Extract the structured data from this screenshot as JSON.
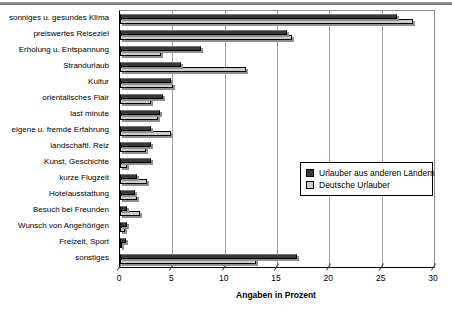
{
  "page": {
    "x_axis_title": "Angaben in Prozent"
  },
  "colors": {
    "series_foreign": "#383838",
    "series_german": "#cdcdcd",
    "gridline": "#a0a0a0",
    "axis": "#000000",
    "plot_border": "#8c8c8c",
    "bar_shadow": "#8f8f8f",
    "top_rule": "#808080",
    "background": "#ffffff"
  },
  "chart_data": {
    "type": "bar",
    "orientation": "horizontal",
    "title": "",
    "xlabel": "Angaben in Prozent",
    "ylabel": "",
    "xlim": [
      0,
      30
    ],
    "xticks": [
      0,
      5,
      10,
      15,
      20,
      25,
      30
    ],
    "grid": true,
    "legend_position": "center-right-inside",
    "categories": [
      "sonniges u. gesundes Klima",
      "preiswertes Reiseziel",
      "Erholung u. Entspannung",
      "Strandurlaub",
      "Kultur",
      "orientalisches Flair",
      "last minute",
      "eigene u. fremde Erfahrung",
      "landschaftl. Reiz",
      "Kunst, Geschichte",
      "kurze Flugzeit",
      "Hotelausstattung",
      "Besuch bei Freunden",
      "Wunsch von Angehörigen",
      "Freizeit, Sport",
      "sonstiges"
    ],
    "series": [
      {
        "name": "Urlauber aus anderen Ländern",
        "color": "#383838",
        "values": [
          26.5,
          16.0,
          7.7,
          5.8,
          4.9,
          4.1,
          3.8,
          3.0,
          3.0,
          3.0,
          1.6,
          1.4,
          0.7,
          0.7,
          0.6,
          16.9
        ]
      },
      {
        "name": "Deutsche Urlauber",
        "color": "#cdcdcd",
        "values": [
          28.0,
          16.4,
          3.9,
          12.0,
          5.1,
          3.0,
          3.6,
          4.9,
          2.5,
          0.7,
          2.6,
          1.6,
          1.9,
          0.5,
          0.2,
          13.0
        ]
      }
    ]
  }
}
